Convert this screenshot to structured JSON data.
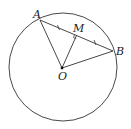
{
  "diagram": {
    "points": {
      "A": {
        "label": "A",
        "x": 40,
        "y": 20
      },
      "B": {
        "label": "B",
        "x": 113,
        "y": 51
      },
      "O": {
        "label": "O",
        "x": 62,
        "y": 68
      },
      "M": {
        "label": "M",
        "x": 76.5,
        "y": 35.5
      }
    },
    "circle": {
      "cx": 63,
      "cy": 67,
      "r": 54
    },
    "segments": [
      "AB",
      "OA",
      "OB",
      "OM"
    ],
    "marks": {
      "equal_ticks": [
        "AM",
        "MB"
      ],
      "right_angle_at": "M"
    },
    "colors": {
      "stroke": "#333333",
      "background": "#ffffff"
    }
  }
}
